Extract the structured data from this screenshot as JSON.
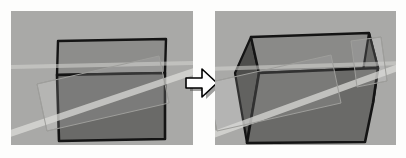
{
  "figure": {
    "background_color": "#fdfdfc",
    "panel_color": "#a9a9a7",
    "outline_color": "#111111",
    "arrow": {
      "name": "right-arrow",
      "label": "transforms into",
      "fill_color": "#ffffff",
      "stroke_color": "#000000",
      "direction": "right"
    },
    "panels": [
      {
        "id": "before",
        "caption": "",
        "shape": {
          "name": "flat-box",
          "description": "Axis-aligned box seen nearly head-on with a light top face and a dark front face",
          "faces": [
            {
              "name": "top-face",
              "color": "#8d8d8b",
              "points": "47,30 155,28 154,62 46,64"
            },
            {
              "name": "front-face",
              "color": "#6a6a68",
              "points": "46,64 154,62 154,128 48,130"
            }
          ]
        },
        "overlay": {
          "name": "tilted-ghost-rectangle",
          "color": "#c3c3c0",
          "opacity": 0.45,
          "points": "26,73 148,45 158,92 36,120"
        },
        "light_band": {
          "name": "diagonal-light-band",
          "color": "#d8d8d4",
          "points": "14,118 182,58 182,64 14,124"
        }
      },
      {
        "id": "after",
        "caption": "",
        "shape": {
          "name": "perspective-box",
          "description": "Wider box rotated so both the left and right side faces are visible",
          "faces": [
            {
              "name": "left-side-face",
              "color": "#505050",
              "points": "22,60 36,26 38,110 36,128"
            },
            {
              "name": "top-face",
              "color": "#878785",
              "points": "36,26 156,22 164,58 42,62"
            },
            {
              "name": "right-side-face",
              "color": "#565654",
              "points": "156,22 164,58 160,92 150,64"
            },
            {
              "name": "front-face",
              "color": "#6a6a68",
              "points": "22,60 42,62 164,58 160,92 150,132 32,134"
            }
          ]
        },
        "overlay": {
          "name": "tilted-ghost-rectangle",
          "color": "#c3c3c0",
          "opacity": 0.45,
          "points": "-6,72 118,44 128,92 4,120"
        },
        "light_band": {
          "name": "diagonal-light-band",
          "color": "#d8d8d4",
          "points": "0,118 181,54 181,60 0,124"
        }
      }
    ]
  }
}
